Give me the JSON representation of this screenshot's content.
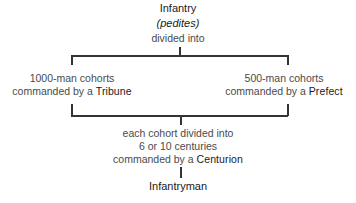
{
  "diagram": {
    "root": {
      "title": "Infantry",
      "subtitle": "(pedites)",
      "connector": "divided into"
    },
    "branches": [
      {
        "line1": "1000-man cohorts",
        "line2_prefix": "commanded by a ",
        "commander": "Tribune"
      },
      {
        "line1": "500-man cohorts",
        "line2_prefix": "commanded by a ",
        "commander": "Prefect"
      }
    ],
    "merge": {
      "line1": "each cohort divided into",
      "line2": "6 or 10 centuries",
      "line3_prefix": "commanded by a ",
      "commander": "Centurion"
    },
    "leaf": {
      "title": "Infantryman"
    }
  }
}
